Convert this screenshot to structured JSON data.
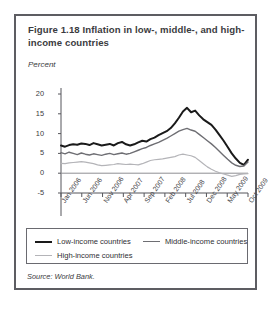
{
  "figure": {
    "title": "Figure 1.18  Inflation in low-, middle-, and high-income countries",
    "source": "Source: World Bank."
  },
  "legend": {
    "items": [
      {
        "label": "Low-income countries",
        "color": "#1a1a1a",
        "width": 2.1
      },
      {
        "label": "Middle-income countries",
        "color": "#6e6e73",
        "width": 1.5
      },
      {
        "label": "High-income countries",
        "color": "#b4b4b8",
        "width": 1.3
      }
    ]
  },
  "chart_data": {
    "type": "line",
    "title": "Inflation in low-, middle-, and high-income countries",
    "xlabel": "",
    "ylabel": "Percent",
    "ylim": [
      -5,
      20
    ],
    "yticks": [
      -5,
      0,
      5,
      10,
      15,
      20
    ],
    "grid": false,
    "zero_line": true,
    "legend_position": "below-plot",
    "xtick_labels": [
      "Jan 2006",
      "Jun 2006",
      "Nov 2006",
      "Apr 2007",
      "Sep 2007",
      "Feb 2008",
      "Jul 2008",
      "Dec 2008",
      "May 2009",
      "Oct 2009"
    ],
    "x": [
      "Jan 2006",
      "Feb 2006",
      "Mar 2006",
      "Apr 2006",
      "May 2006",
      "Jun 2006",
      "Jul 2006",
      "Aug 2006",
      "Sep 2006",
      "Oct 2006",
      "Nov 2006",
      "Dec 2006",
      "Jan 2007",
      "Feb 2007",
      "Mar 2007",
      "Apr 2007",
      "May 2007",
      "Jun 2007",
      "Jul 2007",
      "Aug 2007",
      "Sep 2007",
      "Oct 2007",
      "Nov 2007",
      "Dec 2007",
      "Jan 2008",
      "Feb 2008",
      "Mar 2008",
      "Apr 2008",
      "May 2008",
      "Jun 2008",
      "Jul 2008",
      "Aug 2008",
      "Sep 2008",
      "Oct 2008",
      "Nov 2008",
      "Dec 2008",
      "Jan 2009",
      "Feb 2009",
      "Mar 2009",
      "Apr 2009",
      "May 2009",
      "Jun 2009",
      "Jul 2009",
      "Aug 2009",
      "Sep 2009",
      "Oct 2009",
      "Nov 2009"
    ],
    "series": [
      {
        "name": "Low-income countries",
        "color": "#1a1a1a",
        "values": [
          7.0,
          6.7,
          7.1,
          7.3,
          7.2,
          7.5,
          7.4,
          7.1,
          7.6,
          7.3,
          7.0,
          7.2,
          7.4,
          7.0,
          7.6,
          7.9,
          7.3,
          7.0,
          7.3,
          7.8,
          8.2,
          8.0,
          8.6,
          9.0,
          9.6,
          10.1,
          10.6,
          11.4,
          12.6,
          14.0,
          15.6,
          16.5,
          15.4,
          15.8,
          14.6,
          13.6,
          12.9,
          12.2,
          11.0,
          9.6,
          8.2,
          6.6,
          5.0,
          3.7,
          2.6,
          2.1,
          3.4
        ]
      },
      {
        "name": "Middle-income countries",
        "color": "#6e6e73",
        "values": [
          5.2,
          4.9,
          5.3,
          5.0,
          4.7,
          5.1,
          4.8,
          4.6,
          4.9,
          4.7,
          4.5,
          4.8,
          5.0,
          4.7,
          4.9,
          5.1,
          4.8,
          5.0,
          5.4,
          5.8,
          6.2,
          6.5,
          7.0,
          7.4,
          7.8,
          8.3,
          8.8,
          9.4,
          10.0,
          10.6,
          11.0,
          11.3,
          10.9,
          10.6,
          9.8,
          9.0,
          8.2,
          7.4,
          6.5,
          5.5,
          4.5,
          3.5,
          2.6,
          2.0,
          1.7,
          1.8,
          2.8
        ]
      },
      {
        "name": "High-income countries",
        "color": "#b4b4b8",
        "values": [
          2.5,
          2.4,
          2.6,
          2.7,
          2.8,
          2.9,
          2.8,
          2.6,
          2.4,
          2.1,
          1.9,
          2.0,
          2.1,
          2.2,
          2.4,
          2.3,
          2.2,
          2.3,
          2.2,
          2.1,
          2.4,
          2.8,
          3.2,
          3.4,
          3.5,
          3.6,
          3.8,
          4.0,
          4.2,
          4.6,
          4.8,
          4.6,
          4.4,
          4.0,
          3.2,
          2.4,
          1.6,
          1.0,
          0.5,
          0.1,
          -0.2,
          -0.5,
          -0.8,
          -0.6,
          -0.3,
          -0.2,
          -0.1
        ]
      }
    ]
  }
}
